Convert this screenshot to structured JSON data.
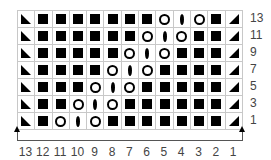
{
  "chart": {
    "rows": [
      {
        "label": "13",
        "cells": [
          "tl",
          "sq",
          "sq",
          "sq",
          "sq",
          "sq",
          "sq",
          "sq",
          "yo",
          "lf",
          "yo",
          "sq",
          "tr"
        ]
      },
      {
        "label": "11",
        "cells": [
          "tl",
          "sq",
          "sq",
          "sq",
          "sq",
          "sq",
          "sq",
          "yo",
          "lf",
          "yo",
          "sq",
          "sq",
          "tr"
        ]
      },
      {
        "label": "9",
        "cells": [
          "tl",
          "sq",
          "sq",
          "sq",
          "sq",
          "sq",
          "yo",
          "lf",
          "yo",
          "sq",
          "sq",
          "sq",
          "tr"
        ]
      },
      {
        "label": "7",
        "cells": [
          "tl",
          "sq",
          "sq",
          "sq",
          "sq",
          "yo",
          "lf",
          "yo",
          "sq",
          "sq",
          "sq",
          "sq",
          "tr"
        ]
      },
      {
        "label": "5",
        "cells": [
          "tl",
          "sq",
          "sq",
          "sq",
          "yo",
          "lf",
          "yo",
          "sq",
          "sq",
          "sq",
          "sq",
          "sq",
          "tr"
        ]
      },
      {
        "label": "3",
        "cells": [
          "tl",
          "sq",
          "sq",
          "yo",
          "lf",
          "yo",
          "sq",
          "sq",
          "sq",
          "sq",
          "sq",
          "sq",
          "tr"
        ]
      },
      {
        "label": "1",
        "cells": [
          "tl",
          "sq",
          "yo",
          "lf",
          "yo",
          "sq",
          "sq",
          "sq",
          "sq",
          "sq",
          "sq",
          "sq",
          "tr"
        ]
      }
    ],
    "column_labels": [
      "13",
      "12",
      "11",
      "10",
      "9",
      "8",
      "7",
      "6",
      "5",
      "4",
      "3",
      "2",
      "1"
    ],
    "symbol_legend": {
      "sq": "filled-square-icon",
      "yo": "open-circle-icon",
      "lf": "leaf-oval-icon",
      "tl": "triangle-left-icon",
      "tr": "triangle-right-icon"
    },
    "colors": {
      "symbol": "#000000",
      "grid": "#c8c8c8",
      "label": "#444444"
    }
  }
}
